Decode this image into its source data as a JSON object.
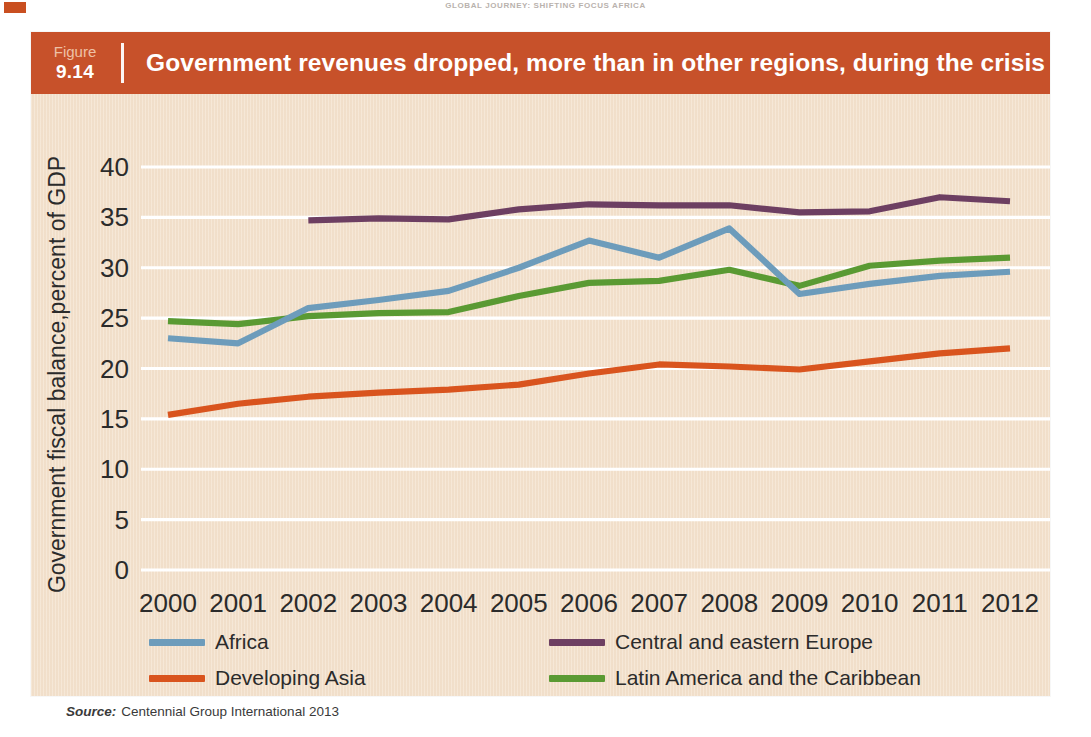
{
  "page": {
    "running_head": "GLOBAL JOURNEY: SHIFTING FOCUS AFRICA",
    "corner_mark_color": "#c94f20"
  },
  "figure": {
    "number_label": "Figure",
    "number_value": "9.14",
    "title": "Government revenues dropped, more than in other regions, during the crisis",
    "header_color": "#c7512a",
    "panel_color": "#f4e3cf",
    "source_label": "Source:",
    "source_text": "Centennial Group International 2013"
  },
  "legend": {
    "items": [
      {
        "label": "Africa",
        "color": "#6d9cbb"
      },
      {
        "label": "Central and eastern Europe",
        "color": "#6d3f62"
      },
      {
        "label": "Developing Asia",
        "color": "#d9541e"
      },
      {
        "label": "Latin America and the Caribbean",
        "color": "#5a9a33"
      }
    ]
  },
  "chart_data": {
    "type": "line",
    "title": "Government revenues dropped, more than in other regions, during the crisis",
    "xlabel": "",
    "ylabel": "Government fiscal balance,percent of GDP",
    "x": [
      2000,
      2001,
      2002,
      2003,
      2004,
      2005,
      2006,
      2007,
      2008,
      2009,
      2010,
      2011,
      2012
    ],
    "xticklabels": [
      "2000",
      "2001",
      "2002",
      "2003",
      "2004",
      "2005",
      "2006",
      "2007",
      "2008",
      "2009",
      "2010",
      "2011",
      "2012"
    ],
    "ylim": [
      0,
      40
    ],
    "yticks": [
      0,
      5,
      10,
      15,
      20,
      25,
      30,
      35,
      40
    ],
    "yticklabels": [
      "0",
      "5",
      "10",
      "15",
      "20",
      "25",
      "30",
      "35",
      "40"
    ],
    "grid": "horizontal",
    "gridline_color": "#ffffff",
    "legend_position": "bottom",
    "series": [
      {
        "name": "Africa",
        "color": "#6d9cbb",
        "values": [
          23.0,
          22.5,
          26.0,
          26.8,
          27.7,
          30.0,
          32.7,
          31.0,
          33.9,
          27.4,
          28.4,
          29.2,
          29.6
        ]
      },
      {
        "name": "Central and eastern Europe",
        "color": "#6d3f62",
        "values": [
          null,
          null,
          34.7,
          34.9,
          34.8,
          35.8,
          36.3,
          36.2,
          36.2,
          35.5,
          35.6,
          37.0,
          36.6
        ]
      },
      {
        "name": "Developing Asia",
        "color": "#d9541e",
        "values": [
          15.4,
          16.5,
          17.2,
          17.6,
          17.9,
          18.4,
          19.5,
          20.4,
          20.2,
          19.9,
          20.7,
          21.5,
          22.0
        ]
      },
      {
        "name": "Latin America and the Caribbean",
        "color": "#5a9a33",
        "values": [
          24.7,
          24.4,
          25.2,
          25.5,
          25.6,
          27.2,
          28.5,
          28.7,
          29.8,
          28.2,
          30.2,
          30.7,
          31.0
        ]
      }
    ]
  }
}
